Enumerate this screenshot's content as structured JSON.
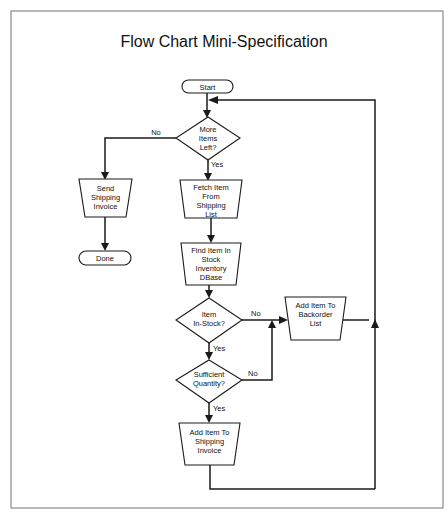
{
  "title": "Flow Chart Mini-Specification",
  "nodes": {
    "start": {
      "type": "terminator",
      "lines": [
        "Start"
      ]
    },
    "more_items": {
      "type": "decision",
      "lines": [
        "More",
        "Items",
        "Left?"
      ]
    },
    "send_invoice": {
      "type": "manual-operation",
      "lines": [
        "Send",
        "Shipping",
        "Invoice"
      ]
    },
    "done": {
      "type": "terminator",
      "lines": [
        "Done"
      ]
    },
    "fetch_item": {
      "type": "manual-operation",
      "lines": [
        "Fetch Item",
        "From",
        "Shipping",
        "List"
      ]
    },
    "find_item": {
      "type": "manual-operation",
      "lines": [
        "Find Item In",
        "Stock",
        "Inventory",
        "DBase"
      ]
    },
    "in_stock": {
      "type": "decision",
      "lines": [
        "Item",
        "In-Stock?"
      ]
    },
    "backorder": {
      "type": "manual-operation",
      "lines": [
        "Add Item To",
        "Backorder",
        "List"
      ]
    },
    "sufficient_qty": {
      "type": "decision",
      "lines": [
        "Sufficient",
        "Quantity?"
      ]
    },
    "add_to_invoice": {
      "type": "manual-operation",
      "lines": [
        "Add Item To",
        "Shipping",
        "Invoice"
      ]
    }
  },
  "edge_labels": {
    "more_no": "No",
    "more_yes": "Yes",
    "stock_no": "No",
    "stock_yes": "Yes",
    "qty_no": "No",
    "qty_yes": "Yes"
  },
  "edges": [
    {
      "from": "start",
      "to": "more_items"
    },
    {
      "from": "more_items",
      "to": "send_invoice",
      "label": "No"
    },
    {
      "from": "more_items",
      "to": "fetch_item",
      "label": "Yes"
    },
    {
      "from": "send_invoice",
      "to": "done"
    },
    {
      "from": "fetch_item",
      "to": "find_item"
    },
    {
      "from": "find_item",
      "to": "in_stock"
    },
    {
      "from": "in_stock",
      "to": "backorder",
      "label": "No"
    },
    {
      "from": "in_stock",
      "to": "sufficient_qty",
      "label": "Yes"
    },
    {
      "from": "sufficient_qty",
      "to": "backorder",
      "label": "No"
    },
    {
      "from": "sufficient_qty",
      "to": "add_to_invoice",
      "label": "Yes"
    },
    {
      "from": "backorder",
      "to": "more_items"
    },
    {
      "from": "add_to_invoice",
      "to": "more_items"
    }
  ]
}
